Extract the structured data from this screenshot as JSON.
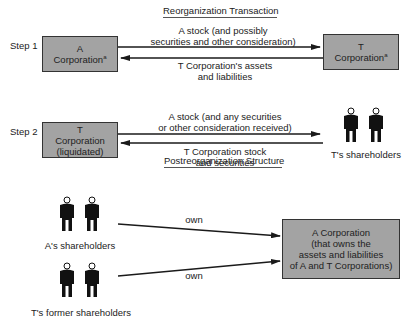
{
  "titles": {
    "reorganization": "Reorganization Transaction",
    "postreorganization": "Postreorganization Structure"
  },
  "step1": {
    "label": "Step 1",
    "box_a": {
      "line1": "A",
      "line2": "Corporation",
      "marker": "a"
    },
    "box_t": {
      "line1": "T",
      "line2": "Corporation",
      "marker": "a"
    },
    "arrow_right": {
      "line1": "A stock (and possibly",
      "line2": "securities and other consideration)"
    },
    "arrow_left": {
      "line1": "T Corporation's assets",
      "line2": "and liabilities"
    }
  },
  "step2": {
    "label": "Step 2",
    "box_t": {
      "line1": "T",
      "line2": "Corporation",
      "line3": "(liquidated)"
    },
    "arrow_right": {
      "line1": "A stock (and any securities",
      "line2": "or other consideration received)"
    },
    "arrow_left": {
      "line1": "T Corporation stock",
      "line2": "and securities"
    },
    "shareholders_label": "T's shareholders"
  },
  "post": {
    "a_shareholders_label": "A's shareholders",
    "t_former_shareholders_label": "T's former shareholders",
    "own_top": "own",
    "own_bottom": "own",
    "box": {
      "line1": "A Corporation",
      "line2": "(that owns the",
      "line3": "assets and liabilities",
      "line4": "of A and T Corporations)"
    }
  },
  "colors": {
    "box_fill": "#a3a3a3",
    "box_border": "#333333",
    "arrow": "#1a1a1a",
    "person": "#111111"
  }
}
